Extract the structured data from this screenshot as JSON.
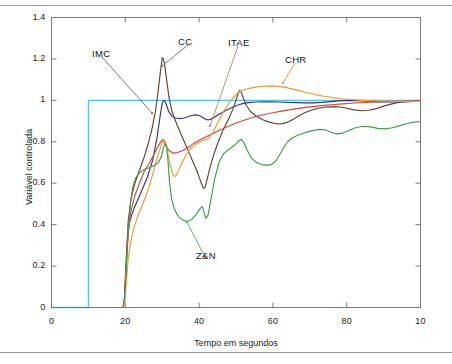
{
  "chart_data": {
    "type": "line",
    "title": "",
    "xlabel": "Tempo em segundos",
    "ylabel": "Variável controlada",
    "xlim": [
      0,
      100
    ],
    "ylim": [
      0,
      1.4
    ],
    "xticks": [
      0,
      20,
      40,
      60,
      80,
      100
    ],
    "xtick_labels": [
      "0",
      "20",
      "40",
      "60",
      "80",
      "10"
    ],
    "yticks": [
      0,
      0.2,
      0.4,
      0.6,
      0.8,
      1,
      1.2,
      1.4
    ],
    "ytick_labels": [
      "0",
      "0.2",
      "0.4",
      "0.6",
      "0.8",
      "1",
      "1.2",
      "1.4"
    ],
    "grid": false,
    "legend_position": "inline-annotations",
    "annotations": [
      {
        "text": "IMC",
        "color": "#6e6e6e",
        "label_x": 92,
        "label_y": 48,
        "tip_x": 152,
        "tip_y": 113
      },
      {
        "text": "CC",
        "color": "#6e6e6e",
        "label_x": 178,
        "label_y": 36,
        "tip_x": 162,
        "tip_y": 66
      },
      {
        "text": "ITAE",
        "color": "#b08a5e",
        "label_x": 228,
        "label_y": 37,
        "tip_x": 210,
        "tip_y": 126
      },
      {
        "text": "CHR",
        "color": "#e8912f",
        "label_x": 285,
        "label_y": 54,
        "tip_x": 283,
        "tip_y": 83
      },
      {
        "text": "Z&N",
        "color": "#5aa05a",
        "label_x": 196,
        "label_y": 250,
        "tip_x": 187,
        "tip_y": 222
      }
    ],
    "series": [
      {
        "name": "Setpoint",
        "color": "#4fc3e8",
        "x": [
          0,
          10,
          10,
          100
        ],
        "y": [
          0,
          0,
          1,
          1
        ]
      },
      {
        "name": "IMC",
        "color": "#33357f",
        "x": [
          0,
          19.4,
          19.8,
          20.2,
          20.6,
          21,
          21.6,
          22.4,
          23.4,
          24.6,
          26,
          27.4,
          28.6,
          29.4,
          30,
          30.4,
          30.8,
          31.2,
          31.8,
          32.6,
          33.6,
          34.8,
          36,
          37.2,
          38.2,
          39,
          39.8,
          40.6,
          41.4,
          42.4,
          43.6,
          45,
          46.6,
          48,
          49.2,
          50.2,
          51,
          51.8,
          52.8,
          54,
          55.6,
          57.4,
          59.4,
          61.6,
          64,
          66.4,
          68.8,
          71,
          73,
          75,
          77,
          79,
          81,
          83,
          85,
          87,
          89,
          91,
          93.5,
          96,
          98,
          100
        ],
        "y": [
          0,
          0,
          0.04,
          0.17,
          0.32,
          0.4,
          0.44,
          0.48,
          0.52,
          0.57,
          0.63,
          0.71,
          0.82,
          0.92,
          0.985,
          1.0,
          0.995,
          0.975,
          0.945,
          0.925,
          0.915,
          0.912,
          0.915,
          0.922,
          0.928,
          0.93,
          0.928,
          0.922,
          0.912,
          0.905,
          0.912,
          0.928,
          0.945,
          0.958,
          0.968,
          0.975,
          0.98,
          0.984,
          0.988,
          0.99,
          0.992,
          0.993,
          0.993,
          0.992,
          0.99,
          0.989,
          0.988,
          0.988,
          0.99,
          0.993,
          0.996,
          0.999,
          1.0,
          0.999,
          0.997,
          0.995,
          0.993,
          0.992,
          0.992,
          0.993,
          0.995,
          0.996
        ]
      },
      {
        "name": "CC",
        "color": "#5e4436",
        "x": [
          0,
          19.4,
          19.8,
          20.2,
          20.8,
          21.6,
          22.6,
          23.8,
          25,
          26.2,
          27.2,
          28.2,
          29,
          29.6,
          30,
          30.3,
          30.7,
          31.2,
          31.8,
          32.6,
          33.6,
          34.8,
          36,
          37.2,
          38.4,
          39.4,
          40.2,
          40.8,
          41.2,
          41.6,
          42.2,
          43,
          44,
          45.2,
          46.6,
          48,
          49.2,
          50,
          50.6,
          51,
          51.4,
          52,
          52.8,
          54,
          55.6,
          57.4,
          59,
          60.6,
          62,
          63.2,
          64.4,
          65.6,
          67,
          68.6,
          70.4,
          72.4,
          74.4,
          76.4,
          78.2,
          80,
          82,
          84,
          86,
          88,
          90,
          92,
          94,
          96,
          98,
          100
        ],
        "y": [
          0,
          0,
          0.05,
          0.22,
          0.42,
          0.53,
          0.6,
          0.66,
          0.72,
          0.79,
          0.86,
          0.95,
          1.06,
          1.15,
          1.205,
          1.2,
          1.17,
          1.1,
          1.02,
          0.95,
          0.9,
          0.85,
          0.8,
          0.75,
          0.7,
          0.66,
          0.62,
          0.59,
          0.575,
          0.58,
          0.62,
          0.68,
          0.74,
          0.8,
          0.86,
          0.91,
          0.96,
          1.0,
          1.035,
          1.048,
          1.04,
          1.01,
          0.975,
          0.945,
          0.922,
          0.905,
          0.895,
          0.888,
          0.886,
          0.89,
          0.898,
          0.91,
          0.925,
          0.94,
          0.952,
          0.962,
          0.968,
          0.97,
          0.968,
          0.962,
          0.954,
          0.95,
          0.952,
          0.96,
          0.972,
          0.982,
          0.99,
          0.995,
          0.997,
          0.996
        ]
      },
      {
        "name": "ITAE",
        "color": "#d1483a",
        "x": [
          0,
          19.4,
          19.8,
          20.2,
          20.8,
          21.6,
          22.6,
          23.8,
          25.2,
          26.6,
          27.8,
          28.8,
          29.6,
          30.1,
          30.6,
          31.2,
          32,
          33,
          34.2,
          35.6,
          37,
          38.4,
          39.8,
          41.2,
          42.6,
          44,
          45.4,
          47,
          48.6,
          50.2,
          52,
          54,
          56,
          58,
          60,
          62,
          64,
          66.5,
          69,
          71.5,
          74,
          76.5,
          79,
          82,
          85,
          88,
          91,
          94,
          97,
          100
        ],
        "y": [
          0,
          0,
          0.04,
          0.18,
          0.36,
          0.47,
          0.54,
          0.6,
          0.66,
          0.7,
          0.74,
          0.775,
          0.8,
          0.81,
          0.8,
          0.775,
          0.755,
          0.745,
          0.748,
          0.758,
          0.772,
          0.79,
          0.805,
          0.818,
          0.83,
          0.842,
          0.854,
          0.868,
          0.88,
          0.892,
          0.903,
          0.915,
          0.925,
          0.933,
          0.94,
          0.947,
          0.953,
          0.96,
          0.966,
          0.971,
          0.976,
          0.98,
          0.983,
          0.987,
          0.99,
          0.992,
          0.994,
          0.995,
          0.996,
          0.996
        ]
      },
      {
        "name": "CHR",
        "color": "#f0992f",
        "x": [
          0,
          19.4,
          19.8,
          20.2,
          20.8,
          21.6,
          22.6,
          23.8,
          25.2,
          26.6,
          28,
          29.2,
          30,
          30.6,
          31.2,
          32,
          32.8,
          33.4,
          33.8,
          34.4,
          35.4,
          36.6,
          38,
          39.4,
          40.8,
          42.2,
          43.6,
          45,
          46.4,
          47.8,
          49.2,
          50.6,
          52,
          53.6,
          55.4,
          57.2,
          59,
          60.8,
          62.6,
          64.6,
          66.8,
          69,
          71.4,
          73.8,
          76.2,
          78.6,
          81,
          83.5,
          86,
          88.5,
          91,
          94,
          97,
          100
        ],
        "y": [
          0,
          0,
          0.02,
          0.1,
          0.24,
          0.33,
          0.4,
          0.46,
          0.52,
          0.59,
          0.68,
          0.755,
          0.795,
          0.81,
          0.78,
          0.7,
          0.648,
          0.632,
          0.638,
          0.66,
          0.7,
          0.74,
          0.772,
          0.792,
          0.805,
          0.812,
          0.84,
          0.89,
          0.94,
          0.98,
          1.012,
          1.038,
          1.05,
          1.058,
          1.064,
          1.068,
          1.07,
          1.069,
          1.065,
          1.058,
          1.048,
          1.038,
          1.028,
          1.02,
          1.013,
          1.008,
          1.004,
          1.001,
          0.999,
          0.997,
          0.996,
          0.995,
          0.995,
          0.995
        ]
      },
      {
        "name": "Z&N",
        "color": "#3f9e4d",
        "x": [
          0,
          19.4,
          19.8,
          20.2,
          20.8,
          21.4,
          22,
          22.8,
          23.8,
          25,
          26.4,
          27.8,
          29,
          29.8,
          30.3,
          30.8,
          31.2,
          31.6,
          32,
          32.6,
          33.4,
          34.4,
          35.6,
          36.8,
          38,
          39,
          39.8,
          40.4,
          40.9,
          41.3,
          41.8,
          42.4,
          43.2,
          44.2,
          45.4,
          46.6,
          47.8,
          49,
          50,
          50.8,
          51.4,
          52,
          53,
          54.2,
          55.6,
          57,
          58.4,
          59.8,
          61,
          62,
          63,
          64,
          65.2,
          66.6,
          68,
          69.4,
          71,
          72.6,
          74.2,
          75.8,
          77.4,
          79,
          80.6,
          82.4,
          84.4,
          86.4,
          88.4,
          90.4,
          92.4,
          94.4,
          96.4,
          98.2,
          100
        ],
        "y": [
          0,
          0,
          0.04,
          0.18,
          0.38,
          0.5,
          0.58,
          0.625,
          0.65,
          0.665,
          0.675,
          0.685,
          0.7,
          0.73,
          0.77,
          0.79,
          0.775,
          0.7,
          0.6,
          0.52,
          0.47,
          0.44,
          0.422,
          0.415,
          0.425,
          0.445,
          0.465,
          0.48,
          0.487,
          0.462,
          0.43,
          0.445,
          0.52,
          0.62,
          0.7,
          0.742,
          0.76,
          0.775,
          0.79,
          0.805,
          0.812,
          0.8,
          0.76,
          0.72,
          0.7,
          0.69,
          0.686,
          0.692,
          0.712,
          0.742,
          0.775,
          0.8,
          0.818,
          0.83,
          0.84,
          0.848,
          0.855,
          0.86,
          0.858,
          0.845,
          0.838,
          0.842,
          0.855,
          0.868,
          0.875,
          0.872,
          0.865,
          0.862,
          0.868,
          0.878,
          0.888,
          0.895,
          0.898
        ]
      }
    ]
  }
}
